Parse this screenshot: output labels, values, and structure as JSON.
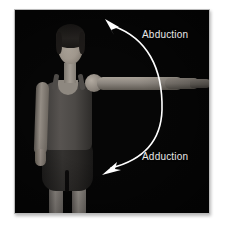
{
  "figure": {
    "name": "shoulder-abduction-adduction-photo",
    "background_color": "#ffffff",
    "photo_background_color": "#060606",
    "frame_border_color": "#b9b9b9",
    "label_color": "#e8e8e8",
    "arrow_color": "#ffffff"
  },
  "labels": {
    "abduction": "Abduction",
    "adduction": "Adduction"
  },
  "annotations": {
    "arrow_description": "double-headed curved arc arrow",
    "upper_arrowhead": "points up-left",
    "lower_arrowhead": "points down-left"
  },
  "subject": {
    "description": "standing person with left arm abducted to horizontal",
    "garment_top": "tank top",
    "garment_bottom": "shorts"
  }
}
